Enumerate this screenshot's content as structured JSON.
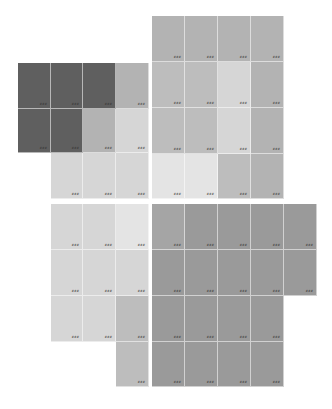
{
  "canvas": {
    "width": 332,
    "height": 409,
    "background": "#ffffff"
  },
  "palette": {
    "dark": "#5f5f5f",
    "mid": "#b3b3b3",
    "mid_alt": "#bdbdbd",
    "light": "#d6d6d6",
    "lighter": "#e4e4e4",
    "bottom_dark": "#9a9a9a",
    "bottom_dark_alt": "#a5a5a5"
  },
  "label_note": "Each tile carries a tiny 3-digit label in its bottom-right corner; glyphs are not legible at screenshot resolution.",
  "tiles": [
    {
      "x": 18,
      "y": 63,
      "w": 33,
      "h": 46,
      "color": "dark",
      "label": "###"
    },
    {
      "x": 51,
      "y": 63,
      "w": 32,
      "h": 46,
      "color": "dark",
      "label": "###"
    },
    {
      "x": 83,
      "y": 63,
      "w": 33,
      "h": 46,
      "color": "dark",
      "label": "###"
    },
    {
      "x": 116,
      "y": 63,
      "w": 33,
      "h": 46,
      "color": "mid",
      "label": "###"
    },
    {
      "x": 18,
      "y": 109,
      "w": 33,
      "h": 44,
      "color": "dark",
      "label": "###"
    },
    {
      "x": 51,
      "y": 109,
      "w": 32,
      "h": 44,
      "color": "dark",
      "label": "###"
    },
    {
      "x": 83,
      "y": 109,
      "w": 33,
      "h": 44,
      "color": "mid",
      "label": "###"
    },
    {
      "x": 116,
      "y": 109,
      "w": 33,
      "h": 44,
      "color": "light",
      "label": "###"
    },
    {
      "x": 51,
      "y": 153,
      "w": 32,
      "h": 46,
      "color": "light",
      "label": "###"
    },
    {
      "x": 83,
      "y": 153,
      "w": 33,
      "h": 46,
      "color": "light",
      "label": "###"
    },
    {
      "x": 116,
      "y": 153,
      "w": 33,
      "h": 46,
      "color": "light",
      "label": "###"
    },
    {
      "x": 152,
      "y": 16,
      "w": 33,
      "h": 46,
      "color": "mid",
      "label": "###"
    },
    {
      "x": 185,
      "y": 16,
      "w": 33,
      "h": 46,
      "color": "mid",
      "label": "###"
    },
    {
      "x": 218,
      "y": 16,
      "w": 33,
      "h": 46,
      "color": "mid",
      "label": "###"
    },
    {
      "x": 251,
      "y": 16,
      "w": 33,
      "h": 46,
      "color": "mid",
      "label": "###"
    },
    {
      "x": 152,
      "y": 62,
      "w": 33,
      "h": 46,
      "color": "mid_alt",
      "label": "###"
    },
    {
      "x": 185,
      "y": 62,
      "w": 33,
      "h": 46,
      "color": "mid_alt",
      "label": "###"
    },
    {
      "x": 218,
      "y": 62,
      "w": 33,
      "h": 46,
      "color": "light",
      "label": "###"
    },
    {
      "x": 251,
      "y": 62,
      "w": 33,
      "h": 46,
      "color": "mid",
      "label": "###"
    },
    {
      "x": 152,
      "y": 108,
      "w": 33,
      "h": 46,
      "color": "mid_alt",
      "label": "###"
    },
    {
      "x": 185,
      "y": 108,
      "w": 33,
      "h": 46,
      "color": "mid_alt",
      "label": "###"
    },
    {
      "x": 218,
      "y": 108,
      "w": 33,
      "h": 46,
      "color": "light",
      "label": "###"
    },
    {
      "x": 251,
      "y": 108,
      "w": 33,
      "h": 46,
      "color": "mid",
      "label": "###"
    },
    {
      "x": 152,
      "y": 154,
      "w": 33,
      "h": 45,
      "color": "lighter",
      "label": "###"
    },
    {
      "x": 185,
      "y": 154,
      "w": 33,
      "h": 45,
      "color": "lighter",
      "label": "###"
    },
    {
      "x": 218,
      "y": 154,
      "w": 33,
      "h": 45,
      "color": "mid_alt",
      "label": "###"
    },
    {
      "x": 251,
      "y": 154,
      "w": 33,
      "h": 45,
      "color": "mid",
      "label": "###"
    },
    {
      "x": 51,
      "y": 204,
      "w": 32,
      "h": 46,
      "color": "light",
      "label": "###"
    },
    {
      "x": 83,
      "y": 204,
      "w": 33,
      "h": 46,
      "color": "light",
      "label": "###"
    },
    {
      "x": 116,
      "y": 204,
      "w": 33,
      "h": 46,
      "color": "lighter",
      "label": "###"
    },
    {
      "x": 51,
      "y": 250,
      "w": 32,
      "h": 46,
      "color": "light",
      "label": "###"
    },
    {
      "x": 83,
      "y": 250,
      "w": 33,
      "h": 46,
      "color": "light",
      "label": "###"
    },
    {
      "x": 116,
      "y": 250,
      "w": 33,
      "h": 46,
      "color": "light",
      "label": "###"
    },
    {
      "x": 51,
      "y": 296,
      "w": 32,
      "h": 46,
      "color": "light",
      "label": "###"
    },
    {
      "x": 83,
      "y": 296,
      "w": 33,
      "h": 46,
      "color": "light",
      "label": "###"
    },
    {
      "x": 116,
      "y": 296,
      "w": 33,
      "h": 46,
      "color": "mid_alt",
      "label": "###"
    },
    {
      "x": 116,
      "y": 342,
      "w": 33,
      "h": 45,
      "color": "mid_alt",
      "label": "###"
    },
    {
      "x": 152,
      "y": 204,
      "w": 33,
      "h": 46,
      "color": "bottom_dark_alt",
      "label": "###"
    },
    {
      "x": 185,
      "y": 204,
      "w": 33,
      "h": 46,
      "color": "bottom_dark",
      "label": "###"
    },
    {
      "x": 218,
      "y": 204,
      "w": 33,
      "h": 46,
      "color": "bottom_dark",
      "label": "###"
    },
    {
      "x": 251,
      "y": 204,
      "w": 33,
      "h": 46,
      "color": "bottom_dark",
      "label": "###"
    },
    {
      "x": 284,
      "y": 204,
      "w": 33,
      "h": 46,
      "color": "bottom_dark",
      "label": "###"
    },
    {
      "x": 152,
      "y": 250,
      "w": 33,
      "h": 46,
      "color": "bottom_dark",
      "label": "###"
    },
    {
      "x": 185,
      "y": 250,
      "w": 33,
      "h": 46,
      "color": "bottom_dark",
      "label": "###"
    },
    {
      "x": 218,
      "y": 250,
      "w": 33,
      "h": 46,
      "color": "bottom_dark",
      "label": "###"
    },
    {
      "x": 251,
      "y": 250,
      "w": 33,
      "h": 46,
      "color": "bottom_dark",
      "label": "###"
    },
    {
      "x": 284,
      "y": 250,
      "w": 33,
      "h": 46,
      "color": "bottom_dark",
      "label": "###"
    },
    {
      "x": 152,
      "y": 296,
      "w": 33,
      "h": 46,
      "color": "bottom_dark",
      "label": "###"
    },
    {
      "x": 185,
      "y": 296,
      "w": 33,
      "h": 46,
      "color": "bottom_dark",
      "label": "###"
    },
    {
      "x": 218,
      "y": 296,
      "w": 33,
      "h": 46,
      "color": "bottom_dark",
      "label": "###"
    },
    {
      "x": 251,
      "y": 296,
      "w": 33,
      "h": 46,
      "color": "bottom_dark",
      "label": "###"
    },
    {
      "x": 152,
      "y": 342,
      "w": 33,
      "h": 45,
      "color": "bottom_dark",
      "label": "###"
    },
    {
      "x": 185,
      "y": 342,
      "w": 33,
      "h": 45,
      "color": "bottom_dark",
      "label": "###"
    },
    {
      "x": 218,
      "y": 342,
      "w": 33,
      "h": 45,
      "color": "bottom_dark",
      "label": "###"
    },
    {
      "x": 251,
      "y": 342,
      "w": 33,
      "h": 45,
      "color": "bottom_dark",
      "label": "###"
    }
  ]
}
